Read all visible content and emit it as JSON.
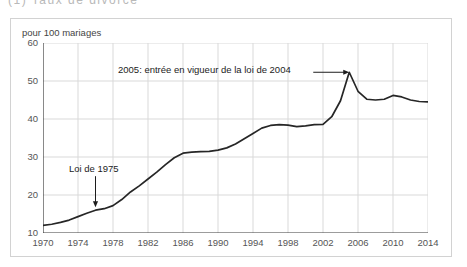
{
  "figure": {
    "cut_off_heading": "(1)  Taux  de  divorce",
    "axis_title": "pour 100 mariages"
  },
  "chart_data": {
    "type": "line",
    "title": "",
    "subtitle": "",
    "xlabel": "",
    "ylabel": "pour 100 mariages",
    "xlim": [
      1970,
      2014
    ],
    "ylim": [
      10,
      60
    ],
    "yticks": [
      10,
      20,
      30,
      40,
      50,
      60
    ],
    "xticks": [
      1970,
      1974,
      1978,
      1982,
      1986,
      1990,
      1994,
      1998,
      2002,
      2006,
      2010,
      2014
    ],
    "grid": true,
    "legend_position": "none",
    "line_color": "#262626",
    "x": [
      1970,
      1971,
      1972,
      1973,
      1974,
      1975,
      1976,
      1977,
      1978,
      1979,
      1980,
      1981,
      1982,
      1983,
      1984,
      1985,
      1986,
      1987,
      1988,
      1989,
      1990,
      1991,
      1992,
      1993,
      1994,
      1995,
      1996,
      1997,
      1998,
      1999,
      2000,
      2001,
      2002,
      2003,
      2004,
      2005,
      2006,
      2007,
      2008,
      2009,
      2010,
      2011,
      2012,
      2013,
      2014
    ],
    "values": [
      12.0,
      12.3,
      12.8,
      13.4,
      14.3,
      15.2,
      16.0,
      16.4,
      17.2,
      18.8,
      20.8,
      22.4,
      24.2,
      26.0,
      28.0,
      29.8,
      31.0,
      31.3,
      31.4,
      31.5,
      31.8,
      32.4,
      33.4,
      34.8,
      36.2,
      37.6,
      38.3,
      38.5,
      38.4,
      38.0,
      38.2,
      38.5,
      38.6,
      40.6,
      44.8,
      52.3,
      47.3,
      45.2,
      45.0,
      45.2,
      46.2,
      45.8,
      45.0,
      44.6,
      44.5
    ],
    "annotations": [
      {
        "name": "peak-annotation",
        "text": "2005: entrée en vigueur de la loi de 2004",
        "points_to_x": 2005,
        "points_to_y": 52.3
      },
      {
        "name": "law-1975-annotation",
        "text": "Loi de 1975",
        "points_to_x": 1976,
        "points_to_y": 16.0
      }
    ]
  }
}
